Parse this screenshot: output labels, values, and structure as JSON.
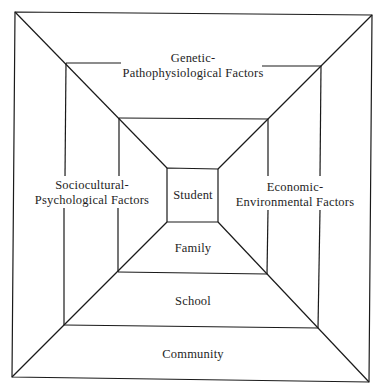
{
  "diagram": {
    "type": "nested-squares",
    "levels": [
      {
        "id": "student",
        "label": "Student"
      },
      {
        "id": "family",
        "label": "Family"
      },
      {
        "id": "school",
        "label": "School"
      },
      {
        "id": "community",
        "label": "Community"
      }
    ],
    "factors": {
      "top": {
        "line1": "Genetic-",
        "line2": "Pathophysiological Factors"
      },
      "left": {
        "line1": "Sociocultural-",
        "line2": "Psychological Factors"
      },
      "right": {
        "line1": "Economic-",
        "line2": "Environmental Factors"
      }
    },
    "colors": {
      "line": "#1a1a1a",
      "text": "#1e1e1e",
      "background": "#ffffff"
    }
  }
}
